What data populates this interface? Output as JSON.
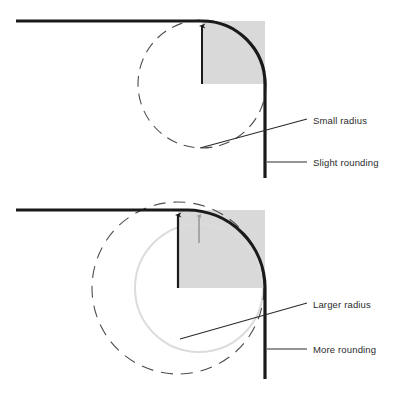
{
  "figure": {
    "colors": {
      "stroke_dark": "#1a1a1a",
      "shade_fill": "#d9d9d9",
      "light_circle": "#dcdcdc",
      "dashed_circle": "#4d4d4d",
      "gray_arrow": "#9a9a9a",
      "leader_line": "#2b2b2b",
      "background": "#ffffff"
    }
  },
  "panels": [
    {
      "id": "top-panel",
      "name": "small-radius-panel",
      "radius_label": "Small radius",
      "rounding_label": "Slight rounding",
      "corner": {
        "x": 265,
        "y": 21
      },
      "arc_radius": 63,
      "circle_center": {
        "x": 202,
        "y": 84
      },
      "dashed_circle_radius": 64,
      "arrow": {
        "x": 202,
        "y_from": 84,
        "y_to": 21
      },
      "shaded_quadrant": {
        "x": 202,
        "y": 21,
        "w": 63,
        "h": 63
      },
      "horizontal_line": {
        "x1": 16,
        "x2": 265,
        "y": 21
      },
      "vertical_line": {
        "x": 265,
        "y1": 84,
        "y2": 178
      }
    },
    {
      "id": "bottom-panel",
      "name": "larger-radius-panel",
      "radius_label": "Larger radius",
      "rounding_label": "More rounding",
      "corner": {
        "x": 265,
        "y": 210
      },
      "arc_radius": 78,
      "dashed_circle_center": {
        "x": 178,
        "y": 288
      },
      "dashed_circle_radius": 86,
      "light_circle_center": {
        "x": 199,
        "y": 288
      },
      "light_circle_radius": 64,
      "arrow_black": {
        "x": 178,
        "y_from": 288,
        "y_to": 210
      },
      "arrow_gray": {
        "x": 199,
        "y_from": 243,
        "y_to": 211
      },
      "shaded_quadrant": {
        "x": 178,
        "y": 210,
        "w": 87,
        "h": 78
      },
      "horizontal_line": {
        "x1": 16,
        "x2": 265,
        "y": 210
      },
      "vertical_line": {
        "x": 265,
        "y1": 288,
        "y2": 379
      }
    }
  ],
  "annotations": [
    {
      "name": "small-radius-annotation",
      "label": "Small radius",
      "text_x": 313,
      "text_y": 124,
      "leader": {
        "x1": 200,
        "y1": 148,
        "x2": 307,
        "y2": 119
      }
    },
    {
      "name": "slight-rounding-annotation",
      "label": "Slight rounding",
      "text_x": 313,
      "text_y": 166,
      "leader": {
        "x1": 267,
        "y1": 162,
        "x2": 307,
        "y2": 162
      }
    },
    {
      "name": "larger-radius-annotation",
      "label": "Larger radius",
      "text_x": 313,
      "text_y": 308,
      "leader": {
        "x1": 180,
        "y1": 339,
        "x2": 307,
        "y2": 303
      }
    },
    {
      "name": "more-rounding-annotation",
      "label": "More rounding",
      "text_x": 313,
      "text_y": 353,
      "leader": {
        "x1": 267,
        "y1": 349,
        "x2": 307,
        "y2": 349
      }
    }
  ]
}
